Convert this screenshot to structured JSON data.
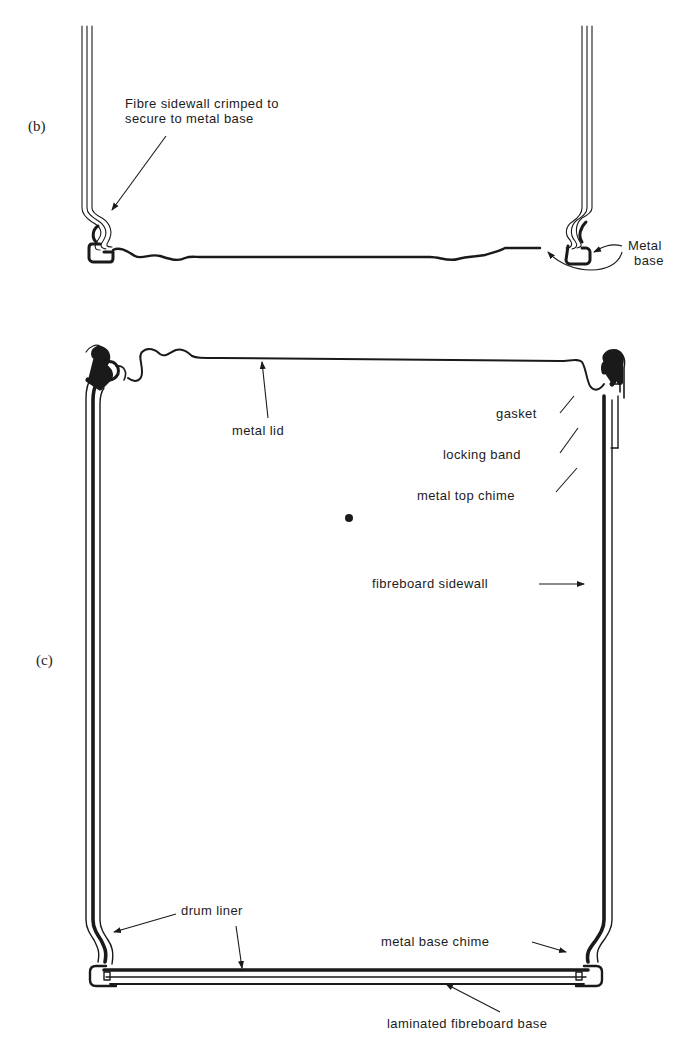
{
  "figure": {
    "panels": [
      {
        "id": "b",
        "label": "(b)",
        "annotations": [
          {
            "text_line1": "Fibre sidewall crimped to",
            "text_line2": "secure to metal base",
            "target": "left crimp"
          },
          {
            "text_line1": "Metal",
            "text_line2": "base",
            "target": "metal base chime (both sides)"
          }
        ]
      },
      {
        "id": "c",
        "label": "(c)",
        "annotations": [
          {
            "text": "metal lid"
          },
          {
            "text": "gasket"
          },
          {
            "text": "locking band"
          },
          {
            "text": "metal top chime"
          },
          {
            "text": "fibreboard sidewall"
          },
          {
            "text": "drum liner"
          },
          {
            "text": "metal base chime"
          },
          {
            "text": "laminated fibreboard base"
          }
        ]
      }
    ],
    "colors": {
      "ink": "#1a1a1a",
      "background": "#ffffff"
    }
  }
}
